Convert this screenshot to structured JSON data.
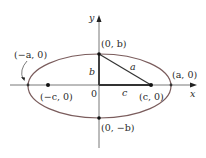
{
  "diagram": {
    "type": "ellipse-foci",
    "axes": {
      "x_label": "x",
      "y_label": "y",
      "origin_label": "0"
    },
    "points": {
      "left_vertex": "(−a, 0)",
      "right_vertex": "(a, 0)",
      "top_vertex": "(0, b)",
      "bottom_vertex": "(0, −b)",
      "left_focus": "(−c, 0)",
      "right_focus": "(c, 0)"
    },
    "segments": {
      "vertical_leg": "b",
      "horizontal_leg": "c",
      "hypotenuse": "a"
    },
    "colors": {
      "ellipse": "#7a5c5c",
      "triangle": "#3a3a3a",
      "axes": "#444444",
      "points": "#111111"
    }
  }
}
